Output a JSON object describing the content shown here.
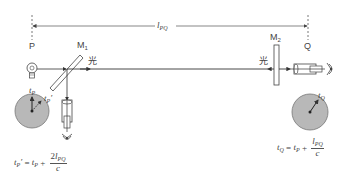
{
  "diagram": {
    "points": {
      "p_label": "P",
      "q_label": "Q"
    },
    "distance": {
      "symbol": "l",
      "subscript": "PQ"
    },
    "mirrors": {
      "m1_label": "M",
      "m1_sub": "1",
      "m2_label": "M",
      "m2_sub": "2"
    },
    "light_labels": {
      "outgoing": "光",
      "returning": "光"
    },
    "clocks": {
      "p_clock": {
        "hand1_label": "t",
        "hand1_sub": "P",
        "hand2_label": "t",
        "hand2_sub": "P",
        "hand2_prime": "′"
      },
      "q_clock": {
        "hand_label": "t",
        "hand_sub": "Q"
      }
    },
    "equations": {
      "p_equation": {
        "lhs": "t",
        "lhs_sub": "P",
        "lhs_prime": "′",
        "equals": " = ",
        "rhs_t": "t",
        "rhs_sub": "P",
        "plus": " + ",
        "numerator_coeff": "2",
        "numerator_l": "l",
        "numerator_sub": "PQ",
        "denominator": "c"
      },
      "q_equation": {
        "lhs": "t",
        "lhs_sub": "Q",
        "equals": " = ",
        "rhs_t": "t",
        "rhs_sub": "P",
        "plus": " + ",
        "numerator_l": "l",
        "numerator_sub": "PQ",
        "denominator": "c"
      }
    },
    "colors": {
      "line": "#444444",
      "clock_face": "#b8b8b8",
      "clock_border": "#777777",
      "background": "#ffffff"
    }
  }
}
